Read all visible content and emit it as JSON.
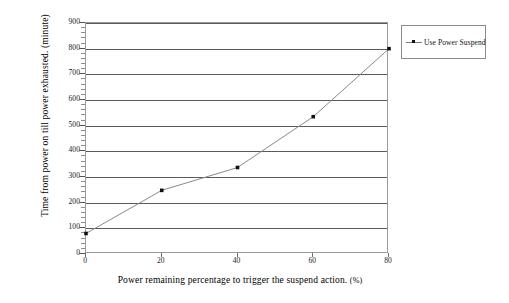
{
  "chart_data": {
    "type": "line",
    "title": "",
    "xlabel": "Power remaining percentage to trigger the suspend action.",
    "xlabel_unit": "(%)",
    "ylabel": "Time from power on till power exhausted. (minute)",
    "x": [
      0,
      20,
      40,
      60,
      80
    ],
    "xlim": [
      0,
      80
    ],
    "ylim": [
      0,
      900
    ],
    "xticks": [
      "0",
      "20",
      "40",
      "60",
      "80"
    ],
    "yticks": [
      "0",
      "100",
      "200",
      "300",
      "400",
      "500",
      "600",
      "700",
      "800",
      "900"
    ],
    "grid": "horizontal",
    "legend_position": "right",
    "series": [
      {
        "name": "Use Power Suspend",
        "marker": "square",
        "line_style": "solid",
        "line_color": "#8a8a8a",
        "marker_color": "#111111",
        "values": [
          80,
          248,
          337,
          535,
          800
        ]
      }
    ]
  },
  "legend": {
    "entries": [
      {
        "label": "Use Power Suspend"
      }
    ]
  },
  "colors": {
    "gridline": "#5a5a5a",
    "frame": "#9a9a9a",
    "series_line": "#8a8a8a",
    "marker": "#111111",
    "background": "#ffffff",
    "text": "#000000"
  }
}
